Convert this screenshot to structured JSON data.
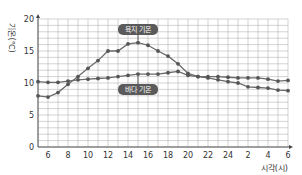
{
  "chart_data": {
    "type": "line",
    "title": "",
    "xlabel": "시각(시)",
    "ylabel": "기온(℃)",
    "ylim": [
      0,
      20
    ],
    "yticks": [
      0,
      5,
      10,
      15,
      20
    ],
    "x_hours": [
      5,
      6,
      7,
      8,
      9,
      10,
      11,
      12,
      13,
      14,
      15,
      16,
      17,
      18,
      19,
      20,
      21,
      22,
      23,
      24,
      25,
      26,
      27,
      28,
      29,
      30
    ],
    "xtick_labels": [
      {
        "hour": 6,
        "label": "6"
      },
      {
        "hour": 8,
        "label": "8"
      },
      {
        "hour": 10,
        "label": "10"
      },
      {
        "hour": 12,
        "label": "12"
      },
      {
        "hour": 14,
        "label": "14"
      },
      {
        "hour": 16,
        "label": "16"
      },
      {
        "hour": 18,
        "label": "18"
      },
      {
        "hour": 20,
        "label": "20"
      },
      {
        "hour": 22,
        "label": "22"
      },
      {
        "hour": 24,
        "label": "24"
      },
      {
        "hour": 26,
        "label": "2"
      },
      {
        "hour": 28,
        "label": "4"
      },
      {
        "hour": 30,
        "label": "6"
      }
    ],
    "grid": true,
    "series": [
      {
        "name": "육지 기온",
        "values": [
          8.0,
          7.8,
          8.5,
          9.8,
          11.0,
          12.3,
          13.5,
          15.0,
          15.0,
          16.1,
          16.3,
          15.9,
          15.0,
          14.2,
          13.0,
          11.5,
          11.0,
          10.8,
          10.5,
          10.2,
          10.0,
          9.4,
          9.3,
          9.2,
          8.9,
          8.8
        ]
      },
      {
        "name": "바다 기온",
        "values": [
          10.2,
          10.1,
          10.1,
          10.3,
          10.5,
          10.6,
          10.7,
          10.8,
          11.0,
          11.2,
          11.4,
          11.4,
          11.4,
          11.6,
          11.8,
          11.2,
          11.0,
          11.0,
          11.0,
          10.9,
          10.8,
          10.8,
          10.8,
          10.6,
          10.3,
          10.4
        ]
      }
    ],
    "annotations": [
      {
        "text": "육지 기온",
        "series": "육지 기온",
        "near_hour": 15,
        "placement": "above"
      },
      {
        "text": "바다 기온",
        "series": "바다 기온",
        "near_hour": 15,
        "placement": "below"
      }
    ],
    "legend": "none"
  }
}
